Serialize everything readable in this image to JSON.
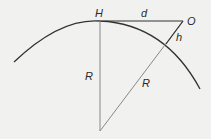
{
  "diagram": {
    "type": "geometry-horizon-distance",
    "labels": {
      "H": "H",
      "d": "d",
      "O": "O",
      "h": "h",
      "R_vertical": "R",
      "R_slanted": "R"
    },
    "colors": {
      "background": "#f1f1ef",
      "arc": "#333333",
      "lines": "#777777",
      "top_line": "#333333",
      "text": "#2a2a2a"
    }
  }
}
